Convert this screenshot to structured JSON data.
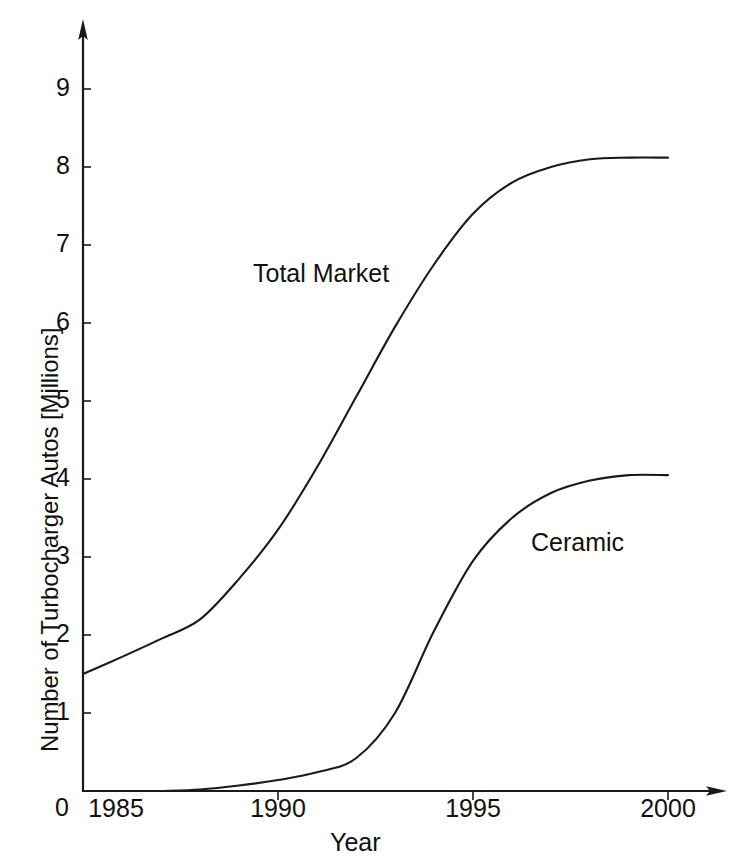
{
  "chart_data": {
    "type": "line",
    "title": "",
    "xlabel": "Year",
    "ylabel": "Number of Turbocharger Autos [Millions]",
    "xlim": [
      1985,
      2001
    ],
    "ylim": [
      0,
      9.4
    ],
    "grid": false,
    "legend_position": "inline-annotation",
    "origin_label": "0",
    "xticks": [
      1985,
      1990,
      1995,
      2000
    ],
    "xtick_labels": [
      "1985",
      "1990",
      "1995",
      "2000"
    ],
    "yticks": [
      1,
      2,
      3,
      4,
      5,
      6,
      7,
      8,
      9
    ],
    "ytick_labels": [
      "1",
      "2",
      "3",
      "4",
      "5",
      "6",
      "7",
      "8",
      "9"
    ],
    "series": [
      {
        "name": "Total Market",
        "label": "Total Market",
        "color": "#1a1a1a",
        "x": [
          1985,
          1986,
          1987,
          1988,
          1989,
          1990,
          1991,
          1992,
          1993,
          1994,
          1995,
          1996,
          1997,
          1998,
          1999,
          2000
        ],
        "values": [
          1.5,
          1.72,
          1.95,
          2.2,
          2.72,
          3.35,
          4.15,
          5.05,
          5.95,
          6.75,
          7.4,
          7.8,
          8.0,
          8.1,
          8.12,
          8.12
        ]
      },
      {
        "name": "Ceramic",
        "label": "Ceramic",
        "color": "#1a1a1a",
        "x": [
          1985,
          1986,
          1987,
          1988,
          1989,
          1990,
          1991,
          1992,
          1993,
          1994,
          1995,
          1996,
          1997,
          1998,
          1999,
          2000
        ],
        "values": [
          0.0,
          0.0,
          0.0,
          0.02,
          0.07,
          0.14,
          0.24,
          0.42,
          1.0,
          2.05,
          2.95,
          3.5,
          3.82,
          3.98,
          4.05,
          4.05
        ]
      }
    ]
  },
  "axes": {
    "y_title": "Number of Turbocharger Autos [Millions]",
    "x_title": "Year",
    "origin_label": "0"
  },
  "annotations": {
    "total_market": "Total Market",
    "ceramic": "Ceramic"
  }
}
